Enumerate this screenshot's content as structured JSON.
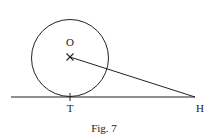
{
  "figure": {
    "caption": "Fig. 7",
    "points": {
      "O": {
        "label": "O"
      },
      "T": {
        "label": "T"
      },
      "H": {
        "label": "H"
      }
    },
    "elements": [
      {
        "type": "circle",
        "center": "O"
      },
      {
        "type": "line",
        "name": "tangent-line",
        "through": [
          "T",
          "H"
        ]
      },
      {
        "type": "segment",
        "from": "O",
        "to": "H"
      }
    ]
  }
}
